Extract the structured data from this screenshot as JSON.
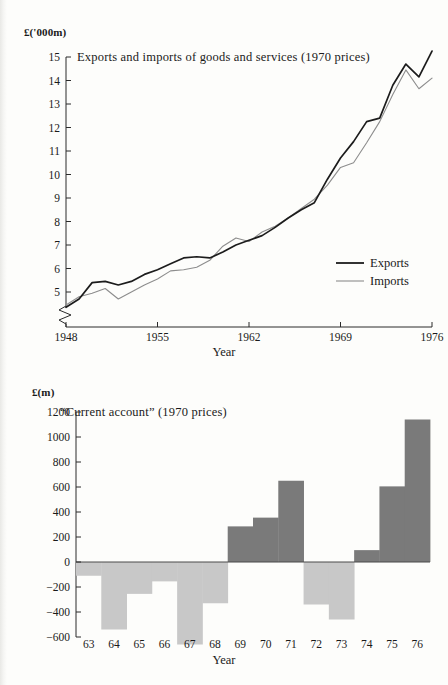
{
  "figures": [
    {
      "id": "exports-imports",
      "unit_label": "£('000m)",
      "title": "Exports and imports of goods and services (1970 prices)",
      "xlabel": "Year",
      "legend": [
        {
          "key": "exports",
          "label": "Exports",
          "color": "#1c1c1c"
        },
        {
          "key": "imports",
          "label": "Imports",
          "color": "#8d8d8d"
        }
      ],
      "yticks": [
        "5",
        "6",
        "7",
        "8",
        "9",
        "10",
        "11",
        "12",
        "13",
        "14",
        "15"
      ],
      "xticks": [
        "1948",
        "1955",
        "1962",
        "1969",
        "1976"
      ],
      "axis_break": true
    },
    {
      "id": "current-account",
      "unit_label": "£(m)",
      "title": "“Current account” (1970 prices)",
      "xlabel": "Year",
      "yticks": [
        "1200",
        "1000",
        "800",
        "600",
        "400",
        "200",
        "0",
        "−200",
        "−400",
        "−600"
      ],
      "xticks": [
        "63",
        "64",
        "65",
        "66",
        "67",
        "68",
        "69",
        "70",
        "71",
        "72",
        "73",
        "74",
        "75",
        "76"
      ],
      "positive_color": "#7a7a7a",
      "negative_color": "#c8c8c8"
    }
  ],
  "chart_data": [
    {
      "type": "line",
      "title": "Exports and imports of goods and services (1970 prices)",
      "xlabel": "Year",
      "ylabel": "£('000m)",
      "xlim": [
        1948,
        1976
      ],
      "ylim": [
        4.3,
        15.3
      ],
      "ytick_values": [
        5,
        6,
        7,
        8,
        9,
        10,
        11,
        12,
        13,
        14,
        15
      ],
      "xtick_values": [
        1948,
        1955,
        1962,
        1969,
        1976
      ],
      "grid": false,
      "axis_break_below": 5,
      "legend_position": "lower-right",
      "x": [
        1948,
        1949,
        1950,
        1951,
        1952,
        1953,
        1954,
        1955,
        1956,
        1957,
        1958,
        1959,
        1960,
        1961,
        1962,
        1963,
        1964,
        1965,
        1966,
        1967,
        1968,
        1969,
        1970,
        1971,
        1972,
        1973,
        1974,
        1975,
        1976
      ],
      "series": [
        {
          "name": "Exports",
          "color": "#1c1c1c",
          "values": [
            4.35,
            4.7,
            5.4,
            5.45,
            5.3,
            5.45,
            5.75,
            5.95,
            6.2,
            6.45,
            6.5,
            6.45,
            6.7,
            7.0,
            7.2,
            7.4,
            7.75,
            8.15,
            8.5,
            8.8,
            9.8,
            10.7,
            11.4,
            12.25,
            12.4,
            13.8,
            14.7,
            14.15,
            15.25
          ]
        },
        {
          "name": "Imports",
          "color": "#8d8d8d",
          "values": [
            4.45,
            4.8,
            4.95,
            5.15,
            4.7,
            5.0,
            5.3,
            5.55,
            5.9,
            5.95,
            6.05,
            6.35,
            6.95,
            7.3,
            7.15,
            7.55,
            7.8,
            8.15,
            8.55,
            8.95,
            9.55,
            10.3,
            10.5,
            11.35,
            12.25,
            13.4,
            14.45,
            13.65,
            14.1
          ]
        }
      ]
    },
    {
      "type": "bar",
      "title": "“Current account” (1970 prices)",
      "xlabel": "Year",
      "ylabel": "£(m)",
      "ylim": [
        -680,
        1200
      ],
      "ytick_values": [
        1200,
        1000,
        800,
        600,
        400,
        200,
        0,
        -200,
        -400,
        -600
      ],
      "grid": false,
      "categories": [
        "63",
        "64",
        "65",
        "66",
        "67",
        "68",
        "69",
        "70",
        "71",
        "72",
        "73",
        "74",
        "75",
        "76"
      ],
      "values": [
        -110,
        -540,
        -255,
        -155,
        -660,
        -330,
        285,
        355,
        650,
        -340,
        -460,
        95,
        605,
        1140
      ],
      "positive_color": "#7a7a7a",
      "negative_color": "#c8c8c8"
    }
  ]
}
